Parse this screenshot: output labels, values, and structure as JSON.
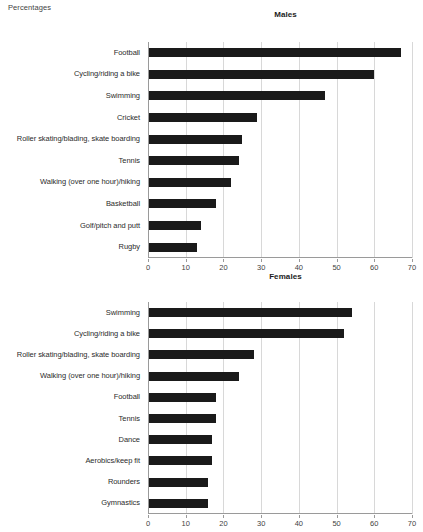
{
  "unit_label": "Percentages",
  "chart_data": [
    {
      "type": "bar",
      "orientation": "horizontal",
      "title": "Males",
      "xlabel": "",
      "ylabel": "",
      "xlim": [
        0,
        70
      ],
      "xticks": [
        0,
        10,
        20,
        30,
        40,
        50,
        60,
        70
      ],
      "grid": true,
      "legend": "none",
      "bar_color": "#1a1a1a",
      "categories": [
        "Football",
        "Cycling/riding a bike",
        "Swimming",
        "Cricket",
        "Roller skating/blading, skate boarding",
        "Tennis",
        "Walking (over one hour)/hiking",
        "Basketball",
        "Golf/pitch and putt",
        "Rugby"
      ],
      "values": [
        67,
        60,
        47,
        29,
        25,
        24,
        22,
        18,
        14,
        13
      ]
    },
    {
      "type": "bar",
      "orientation": "horizontal",
      "title": "Females",
      "xlabel": "",
      "ylabel": "",
      "xlim": [
        0,
        70
      ],
      "xticks": [
        0,
        10,
        20,
        30,
        40,
        50,
        60,
        70
      ],
      "grid": true,
      "legend": "none",
      "bar_color": "#1a1a1a",
      "categories": [
        "Swimming",
        "Cycling/riding a bike",
        "Roller skating/blading, skate boarding",
        "Walking (over one hour)/hiking",
        "Football",
        "Tennis",
        "Dance",
        "Aerobics/keep fit",
        "Rounders",
        "Gymnastics"
      ],
      "values": [
        54,
        52,
        28,
        24,
        18,
        18,
        17,
        17,
        16,
        16
      ]
    }
  ]
}
